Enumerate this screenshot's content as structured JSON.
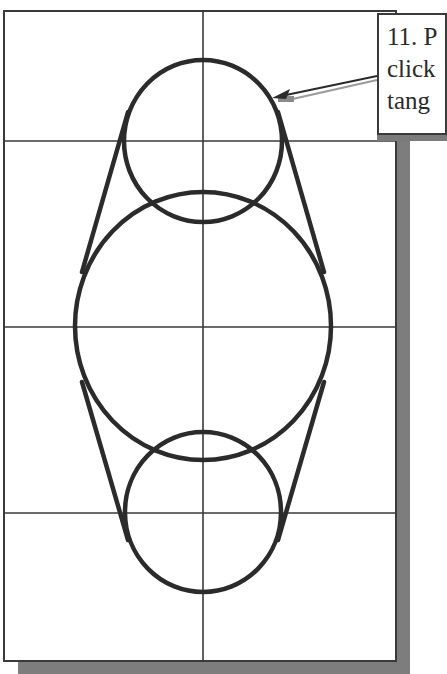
{
  "figure": {
    "background": "#ffffff",
    "line_color": "#2b2b2b",
    "grid_color": "#3a3a3a",
    "shadow_color": "#7d7d7d",
    "frame": {
      "x": 4,
      "y": 11,
      "width": 392,
      "height": 650,
      "shadow_offset": 14
    },
    "grid": {
      "vertical_x": [
        203
      ],
      "horizontal_y": [
        141,
        327,
        513
      ]
    },
    "circles": [
      {
        "name": "top-circle",
        "cx": 203,
        "cy": 141,
        "rx": 79,
        "ry": 81
      },
      {
        "name": "large-circle",
        "cx": 203,
        "cy": 326,
        "rx": 128,
        "ry": 134
      },
      {
        "name": "bottom-circle",
        "cx": 203,
        "cy": 512,
        "rx": 78,
        "ry": 80
      }
    ],
    "tangent_lines": [
      {
        "name": "upper-left-tangent",
        "x1": 128,
        "y1": 112,
        "x2": 82,
        "y2": 272
      },
      {
        "name": "upper-right-tangent",
        "x1": 278,
        "y1": 112,
        "x2": 324,
        "y2": 272
      },
      {
        "name": "lower-left-tangent",
        "x1": 82,
        "y1": 382,
        "x2": 128,
        "y2": 540
      },
      {
        "name": "lower-right-tangent",
        "x1": 324,
        "y1": 382,
        "x2": 278,
        "y2": 540
      }
    ]
  },
  "callout": {
    "lines": [
      "11. P",
      "click",
      "tang"
    ],
    "leader": {
      "from_x": 377,
      "from_y": 76,
      "to_x": 272,
      "to_y": 98
    }
  }
}
